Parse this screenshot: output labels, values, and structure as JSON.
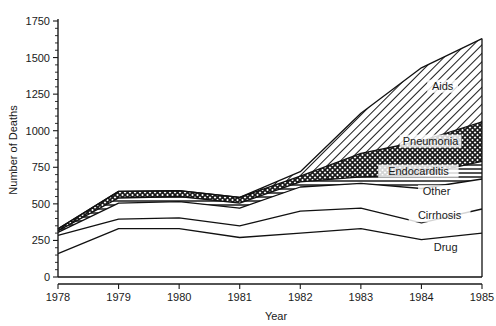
{
  "chart_data": {
    "type": "area",
    "title": "",
    "subtitle": "",
    "xlabel": "Year",
    "ylabel": "Number of Deaths",
    "categories": [
      "1978",
      "1979",
      "1980",
      "1981",
      "1982",
      "1983",
      "1984",
      "1985"
    ],
    "x": [
      1978,
      1979,
      1980,
      1981,
      1982,
      1983,
      1984,
      1985
    ],
    "xlim": [
      1978,
      1985
    ],
    "ylim": [
      0,
      1750
    ],
    "ytick_values": [
      0,
      250,
      500,
      750,
      1000,
      1250,
      1500,
      1750
    ],
    "ytick_labels": [
      "0",
      "250",
      "500",
      "750",
      "1000",
      "1250",
      "1500",
      "1750"
    ],
    "yminor_step": 50,
    "grid": false,
    "legend_position": "inline-right",
    "stacked": true,
    "stack_order_bottom_to_top": [
      "Drug",
      "Cirrhosis",
      "Other",
      "Endocarditis",
      "Pneumonia",
      "Aids"
    ],
    "series": [
      {
        "name": "Drug",
        "fill": "none",
        "values": [
          160,
          330,
          330,
          270,
          300,
          330,
          255,
          300
        ]
      },
      {
        "name": "Cirrhosis",
        "fill": "none",
        "values": [
          125,
          65,
          75,
          80,
          150,
          140,
          115,
          165
        ]
      },
      {
        "name": "Other",
        "fill": "none",
        "values": [
          20,
          110,
          110,
          120,
          165,
          170,
          235,
          205
        ]
      },
      {
        "name": "Endocarditis",
        "fill": "horizontal-lines",
        "values": [
          10,
          35,
          35,
          35,
          35,
          45,
          95,
          120
        ]
      },
      {
        "name": "Pneumonia",
        "fill": "cross-hatch-dots",
        "values": [
          15,
          45,
          40,
          40,
          40,
          160,
          230,
          270
        ]
      },
      {
        "name": "Aids",
        "fill": "diagonal-hatch",
        "values": [
          0,
          0,
          0,
          0,
          30,
          275,
          500,
          570
        ]
      }
    ],
    "cumulative_tops": {
      "Drug": [
        160,
        330,
        330,
        270,
        300,
        330,
        255,
        300
      ],
      "Cirrhosis": [
        285,
        395,
        405,
        350,
        450,
        470,
        370,
        465
      ],
      "Other": [
        305,
        505,
        515,
        470,
        615,
        640,
        605,
        670
      ],
      "Endocarditis": [
        315,
        540,
        550,
        505,
        650,
        685,
        700,
        790
      ],
      "Pneumonia": [
        330,
        585,
        590,
        545,
        690,
        845,
        930,
        1060
      ],
      "Aids": [
        330,
        585,
        590,
        545,
        720,
        1120,
        1430,
        1630
      ]
    },
    "annotations": [
      {
        "text": "Aids",
        "x": 1984.35,
        "y": 1280
      },
      {
        "text": "Pneumonia",
        "x": 1984.15,
        "y": 905
      },
      {
        "text": "Endocarditis",
        "x": 1983.95,
        "y": 700
      },
      {
        "text": "Other",
        "x": 1984.25,
        "y": 560
      },
      {
        "text": "Cirrhosis",
        "x": 1984.3,
        "y": 395
      },
      {
        "text": "Drug",
        "x": 1984.4,
        "y": 175
      }
    ],
    "colors": {
      "axis": "#1a1a1a",
      "line": "#111111",
      "background": "#ffffff",
      "pattern": "#1a1a1a"
    }
  }
}
